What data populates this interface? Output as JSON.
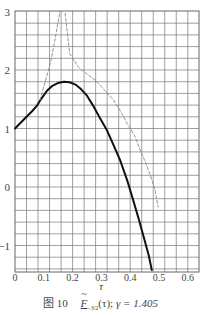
{
  "chart_data": {
    "type": "line",
    "title": "",
    "caption": {
      "figure_label": "图 10",
      "function_symbol": "F",
      "function_subscript": "−3/2",
      "function_arg": "(τ)",
      "separator": ";",
      "param_text": "γ = 1.405"
    },
    "xlabel": "τ",
    "ylabel": "",
    "xlim": [
      0,
      0.64
    ],
    "ylim": [
      -1.45,
      3.0
    ],
    "x_ticks": [
      0,
      0.1,
      0.2,
      0.3,
      0.4,
      0.5,
      0.6
    ],
    "x_tick_labels": [
      "0",
      "0.1",
      "0.2",
      "0.3",
      "0.4",
      "0.5",
      "0.6"
    ],
    "y_ticks": [
      -1,
      0,
      1,
      2,
      3
    ],
    "y_tick_labels": [
      "−1",
      "0",
      "1",
      "2",
      "3"
    ],
    "grid": {
      "on": true,
      "x_step": 0.04,
      "y_step": 0.2
    },
    "legend": null,
    "series": [
      {
        "name": "solid",
        "style": "solid",
        "color": "#111111",
        "points": [
          [
            0.0,
            1.0
          ],
          [
            0.03,
            1.15
          ],
          [
            0.06,
            1.3
          ],
          [
            0.076,
            1.39
          ],
          [
            0.09,
            1.5
          ],
          [
            0.11,
            1.64
          ],
          [
            0.13,
            1.73
          ],
          [
            0.15,
            1.78
          ],
          [
            0.17,
            1.8
          ],
          [
            0.19,
            1.79
          ],
          [
            0.21,
            1.75
          ],
          [
            0.23,
            1.67
          ],
          [
            0.25,
            1.56
          ],
          [
            0.27,
            1.4
          ],
          [
            0.29,
            1.22
          ],
          [
            0.32,
            0.96
          ],
          [
            0.34,
            0.74
          ],
          [
            0.365,
            0.46
          ],
          [
            0.39,
            0.11
          ],
          [
            0.41,
            -0.22
          ],
          [
            0.43,
            -0.55
          ],
          [
            0.45,
            -0.91
          ],
          [
            0.465,
            -1.18
          ],
          [
            0.475,
            -1.42
          ]
        ]
      },
      {
        "name": "dashed",
        "style": "dashed",
        "color": "#888888",
        "segments": [
          [
            [
              0.087,
              1.49
            ],
            [
              0.105,
              1.8
            ],
            [
              0.125,
              2.16
            ],
            [
              0.14,
              2.55
            ],
            [
              0.156,
              3.0
            ]
          ],
          [
            [
              0.174,
              2.97
            ],
            [
              0.19,
              2.28
            ],
            [
              0.22,
              2.05
            ],
            [
              0.25,
              1.93
            ],
            [
              0.28,
              1.82
            ],
            [
              0.31,
              1.66
            ],
            [
              0.34,
              1.5
            ],
            [
              0.365,
              1.31
            ],
            [
              0.39,
              1.08
            ],
            [
              0.415,
              0.88
            ],
            [
              0.435,
              0.63
            ],
            [
              0.455,
              0.4
            ],
            [
              0.47,
              0.2
            ],
            [
              0.486,
              -0.05
            ],
            [
              0.497,
              -0.34
            ]
          ]
        ]
      }
    ]
  }
}
